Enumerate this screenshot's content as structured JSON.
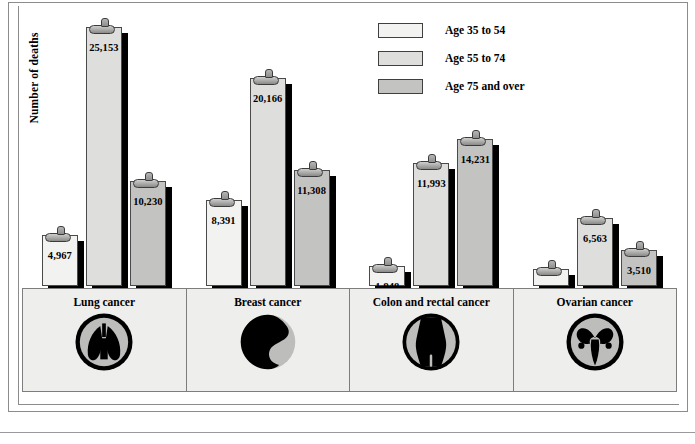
{
  "axis": {
    "ylabel": "Number of deaths"
  },
  "legend": {
    "items": [
      {
        "label": "Age 35 to 54",
        "color": "#f2f2f0"
      },
      {
        "label": "Age 55 to 74",
        "color": "#dededc"
      },
      {
        "label": "Age 75 and over",
        "color": "#c3c3c1"
      }
    ]
  },
  "categories": [
    {
      "label": "Lung cancer",
      "icon": "lungs-icon"
    },
    {
      "label": "Breast cancer",
      "icon": "breast-icon"
    },
    {
      "label": "Colon and rectal cancer",
      "icon": "torso-colon-icon"
    },
    {
      "label": "Ovarian cancer",
      "icon": "uterus-ovaries-icon"
    }
  ],
  "chart_data": {
    "type": "bar",
    "title": "",
    "xlabel": "",
    "ylabel": "Number of deaths",
    "ylim": [
      0,
      27000
    ],
    "grid": false,
    "legend_position": "top-right",
    "categories": [
      "Lung cancer",
      "Breast cancer",
      "Colon and rectal cancer",
      "Ovarian cancer"
    ],
    "series": [
      {
        "name": "Age 35 to 54",
        "color": "#f2f2f0",
        "values": [
          4967,
          8391,
          1948,
          1688
        ],
        "labels": [
          "4,967",
          "8,391",
          "1,948",
          "1,688"
        ]
      },
      {
        "name": "Age 55 to 74",
        "color": "#dededc",
        "values": [
          25153,
          20166,
          11993,
          6563
        ],
        "labels": [
          "25,153",
          "20,166",
          "11,993",
          "6,563"
        ]
      },
      {
        "name": "Age 75 and over",
        "color": "#c3c3c1",
        "values": [
          10230,
          11308,
          14231,
          3510
        ],
        "labels": [
          "10,230",
          "11,308",
          "14,231",
          "3,510"
        ]
      }
    ]
  }
}
